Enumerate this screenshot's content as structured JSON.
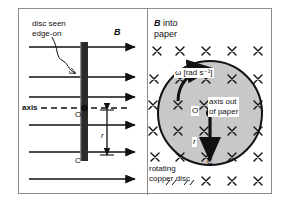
{
  "figure": {
    "panels": [
      {
        "id": "left",
        "name": "edge-on-view",
        "labels": {
          "disc_seen": "disc seen",
          "edge_on": "edge-on",
          "field_symbol": "B",
          "axis": "axis",
          "point_o": "O",
          "point_c": "C",
          "radius": "r"
        },
        "field_lines": {
          "count": 6,
          "direction": "right",
          "y_positions": [
            38,
            68,
            88,
            116,
            143,
            170
          ]
        },
        "disc_bar": {
          "x": 66,
          "top": 34,
          "bottom": 152,
          "color": "#2a2a2a"
        }
      },
      {
        "id": "right",
        "name": "face-on-view",
        "labels": {
          "field_symbol": "B",
          "field_text": "into",
          "field_text2": "paper",
          "omega": "ω [rad s⁻¹]",
          "axis_out": "axis out",
          "axis_out2": "of paper",
          "point_o": "O",
          "point_c": "C",
          "radius": "r",
          "rotating": "rotating",
          "copper_disc": "copper disc"
        },
        "cross_symbol": "×",
        "disc": {
          "cx": 62,
          "cy": 104,
          "r": 52,
          "fill": "#c8c8c8"
        }
      }
    ],
    "colors": {
      "background": "#ffffff",
      "border": "#8c8c8c",
      "ink": "#111111",
      "disc_fill": "#c8c8c8",
      "bar_fill": "#2a2a2a"
    }
  }
}
